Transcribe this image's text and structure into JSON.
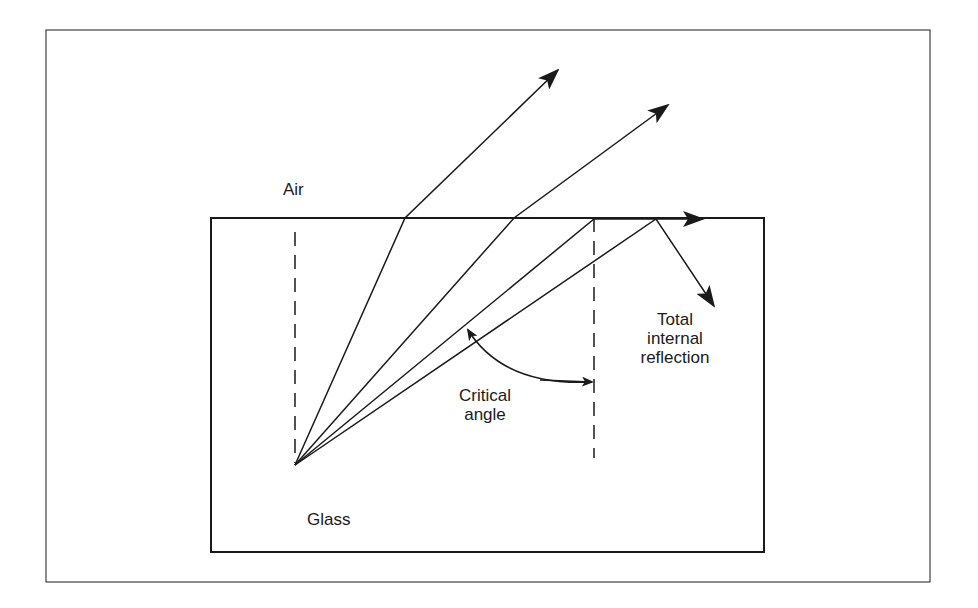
{
  "diagram": {
    "labels": {
      "air": "Air",
      "glass": "Glass",
      "critical_angle_line1": "Critical",
      "critical_angle_line2": "angle",
      "tir_line1": "Total",
      "tir_line2": "internal",
      "tir_line3": "reflection"
    },
    "media": [
      "Air",
      "Glass"
    ],
    "rays": [
      {
        "name": "refracted-ray-1",
        "type": "refraction"
      },
      {
        "name": "refracted-ray-2",
        "type": "refraction"
      },
      {
        "name": "critical-ray",
        "type": "critical"
      },
      {
        "name": "reflected-ray",
        "type": "total-internal-reflection"
      }
    ],
    "colors": {
      "line": "#1a1a1a",
      "background": "#ffffff"
    }
  }
}
